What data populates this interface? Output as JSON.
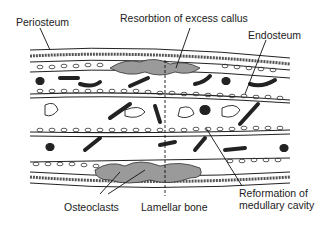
{
  "diagram": {
    "labels": {
      "periosteum": "Periosteum",
      "resorption": "Resorbtion of excess callus",
      "endosteum": "Endosteum",
      "osteoclasts": "Osteoclasts",
      "lamellar_bone": "Lamellar bone",
      "reformation_line1": "Reformation of",
      "reformation_line2": "medullary cavity"
    },
    "colors": {
      "ink": "#222222",
      "callus_gray": "#9a9a9a",
      "background": "#ffffff"
    }
  }
}
